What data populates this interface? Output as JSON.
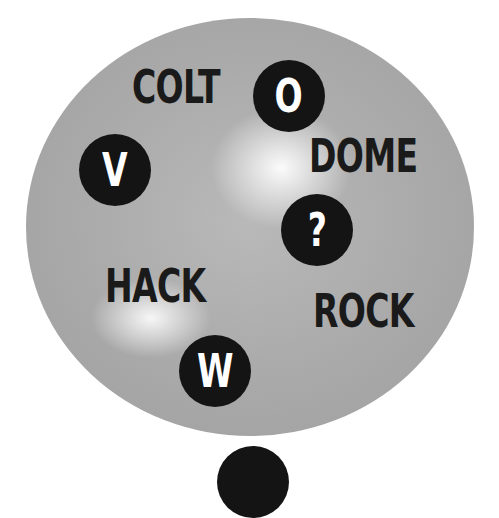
{
  "puzzle": {
    "words": [
      {
        "id": "colt",
        "text": "COLT"
      },
      {
        "id": "dome",
        "text": "DOME"
      },
      {
        "id": "hack",
        "text": "HACK"
      },
      {
        "id": "rock",
        "text": "ROCK"
      }
    ],
    "badges": [
      {
        "id": "o",
        "letter": "O"
      },
      {
        "id": "v",
        "letter": "V"
      },
      {
        "id": "question",
        "letter": "?"
      },
      {
        "id": "w",
        "letter": "W"
      }
    ]
  },
  "colors": {
    "disc_gray": "#a9a9a9",
    "highlight": "#ffffff",
    "badge_fill": "#141414",
    "badge_text": "#ffffff",
    "word_text": "#1a1a1a",
    "background": "#ffffff"
  }
}
